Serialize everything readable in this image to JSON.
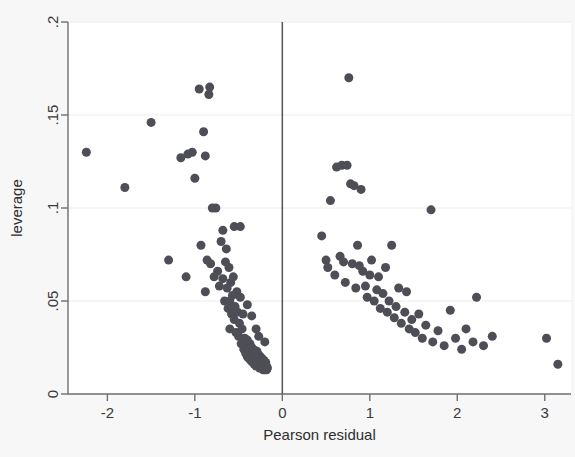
{
  "figure": {
    "background_color": "#f7f7f7",
    "plot_background_color": "#ffffff",
    "marker_color": "#4e4e56",
    "axis_color": "#6f6f6f",
    "gridline_color": "#ececec",
    "refline_color": "#555555"
  },
  "chart_data": {
    "type": "scatter",
    "title": "",
    "xlabel": "Pearson residual",
    "ylabel": "leverage",
    "xlim": [
      -2.45,
      3.3
    ],
    "ylim": [
      0,
      0.2
    ],
    "xticks": [
      -2,
      -1,
      0,
      1,
      2,
      3
    ],
    "xticklabels": [
      "-2",
      "-1",
      "0",
      "1",
      "2",
      "3"
    ],
    "yticks": [
      0,
      0.05,
      0.1,
      0.15,
      0.2
    ],
    "yticklabels": [
      "0",
      ".05",
      ".1",
      ".15",
      ".2"
    ],
    "grid": "horizontal",
    "legend": "none",
    "annotations": [
      {
        "type": "vline",
        "x": 0,
        "label": "zero-residual reference line"
      }
    ],
    "marker_size_px": 9,
    "series": [
      {
        "name": "observations",
        "points": [
          [
            -2.24,
            0.13
          ],
          [
            -1.8,
            0.111
          ],
          [
            -1.5,
            0.146
          ],
          [
            -1.3,
            0.072
          ],
          [
            -1.16,
            0.127
          ],
          [
            -1.08,
            0.129
          ],
          [
            -1.03,
            0.13
          ],
          [
            -1.0,
            0.116
          ],
          [
            -0.95,
            0.164
          ],
          [
            -0.93,
            0.08
          ],
          [
            -0.9,
            0.141
          ],
          [
            -0.88,
            0.128
          ],
          [
            -0.86,
            0.072
          ],
          [
            -0.84,
            0.161
          ],
          [
            -0.83,
            0.165
          ],
          [
            -0.82,
            0.07
          ],
          [
            -0.8,
            0.1
          ],
          [
            -0.78,
            0.063
          ],
          [
            -0.76,
            0.1
          ],
          [
            -0.74,
            0.066
          ],
          [
            -0.72,
            0.058
          ],
          [
            -0.7,
            0.082
          ],
          [
            -0.68,
            0.062
          ],
          [
            -0.66,
            0.05
          ],
          [
            -0.65,
            0.071
          ],
          [
            -0.64,
            0.078
          ],
          [
            -0.63,
            0.057
          ],
          [
            -0.62,
            0.046
          ],
          [
            -0.61,
            0.068
          ],
          [
            -0.6,
            0.05
          ],
          [
            -0.59,
            0.06
          ],
          [
            -0.58,
            0.043
          ],
          [
            -0.57,
            0.053
          ],
          [
            -0.56,
            0.063
          ],
          [
            -0.55,
            0.04
          ],
          [
            -0.54,
            0.047
          ],
          [
            -0.53,
            0.033
          ],
          [
            -0.52,
            0.055
          ],
          [
            -0.51,
            0.044
          ],
          [
            -0.5,
            0.031
          ],
          [
            -0.49,
            0.038
          ],
          [
            -0.48,
            0.052
          ],
          [
            -0.47,
            0.027
          ],
          [
            -0.46,
            0.035
          ],
          [
            -0.45,
            0.043
          ],
          [
            -0.44,
            0.024
          ],
          [
            -0.43,
            0.03
          ],
          [
            -0.42,
            0.022
          ],
          [
            -0.41,
            0.026
          ],
          [
            -0.4,
            0.02
          ],
          [
            -0.4,
            0.029
          ],
          [
            -0.39,
            0.024
          ],
          [
            -0.38,
            0.019
          ],
          [
            -0.37,
            0.022
          ],
          [
            -0.37,
            0.027
          ],
          [
            -0.36,
            0.018
          ],
          [
            -0.35,
            0.021
          ],
          [
            -0.35,
            0.025
          ],
          [
            -0.34,
            0.017
          ],
          [
            -0.33,
            0.02
          ],
          [
            -0.33,
            0.024
          ],
          [
            -0.32,
            0.019
          ],
          [
            -0.32,
            0.016
          ],
          [
            -0.31,
            0.022
          ],
          [
            -0.31,
            0.018
          ],
          [
            -0.3,
            0.015
          ],
          [
            -0.3,
            0.02
          ],
          [
            -0.29,
            0.017
          ],
          [
            -0.29,
            0.023
          ],
          [
            -0.28,
            0.015
          ],
          [
            -0.28,
            0.019
          ],
          [
            -0.27,
            0.016
          ],
          [
            -0.27,
            0.021
          ],
          [
            -0.26,
            0.014
          ],
          [
            -0.26,
            0.018
          ],
          [
            -0.25,
            0.016
          ],
          [
            -0.25,
            0.02
          ],
          [
            -0.24,
            0.014
          ],
          [
            -0.24,
            0.017
          ],
          [
            -0.23,
            0.015
          ],
          [
            -0.23,
            0.019
          ],
          [
            -0.22,
            0.013
          ],
          [
            -0.22,
            0.016
          ],
          [
            -0.21,
            0.014
          ],
          [
            -0.21,
            0.018
          ],
          [
            -0.2,
            0.013
          ],
          [
            -0.2,
            0.016
          ],
          [
            -0.19,
            0.014
          ],
          [
            -0.19,
            0.017
          ],
          [
            -0.18,
            0.013
          ],
          [
            -0.18,
            0.015
          ],
          [
            -0.17,
            0.014
          ],
          [
            -0.55,
            0.09
          ],
          [
            -0.6,
            0.035
          ],
          [
            -0.68,
            0.088
          ],
          [
            -0.48,
            0.09
          ],
          [
            -0.3,
            0.035
          ],
          [
            -0.88,
            0.055
          ],
          [
            -1.1,
            0.063
          ],
          [
            -0.4,
            0.048
          ],
          [
            -0.35,
            0.042
          ],
          [
            -0.2,
            0.028
          ],
          [
            -0.27,
            0.031
          ],
          [
            0.45,
            0.085
          ],
          [
            0.5,
            0.072
          ],
          [
            0.52,
            0.068
          ],
          [
            0.55,
            0.104
          ],
          [
            0.6,
            0.064
          ],
          [
            0.62,
            0.122
          ],
          [
            0.68,
            0.123
          ],
          [
            0.74,
            0.123
          ],
          [
            0.66,
            0.074
          ],
          [
            0.7,
            0.071
          ],
          [
            0.72,
            0.06
          ],
          [
            0.76,
            0.17
          ],
          [
            0.78,
            0.113
          ],
          [
            0.8,
            0.07
          ],
          [
            0.82,
            0.112
          ],
          [
            0.84,
            0.057
          ],
          [
            0.86,
            0.08
          ],
          [
            0.88,
            0.069
          ],
          [
            0.9,
            0.11
          ],
          [
            0.92,
            0.066
          ],
          [
            0.95,
            0.058
          ],
          [
            0.97,
            0.052
          ],
          [
            1.0,
            0.064
          ],
          [
            1.02,
            0.072
          ],
          [
            1.05,
            0.05
          ],
          [
            1.08,
            0.056
          ],
          [
            1.1,
            0.063
          ],
          [
            1.12,
            0.046
          ],
          [
            1.15,
            0.054
          ],
          [
            1.18,
            0.068
          ],
          [
            1.2,
            0.044
          ],
          [
            1.22,
            0.05
          ],
          [
            1.25,
            0.08
          ],
          [
            1.28,
            0.041
          ],
          [
            1.3,
            0.047
          ],
          [
            1.33,
            0.057
          ],
          [
            1.36,
            0.038
          ],
          [
            1.4,
            0.044
          ],
          [
            1.42,
            0.055
          ],
          [
            1.45,
            0.035
          ],
          [
            1.48,
            0.04
          ],
          [
            1.52,
            0.033
          ],
          [
            1.56,
            0.043
          ],
          [
            1.6,
            0.03
          ],
          [
            1.64,
            0.037
          ],
          [
            1.7,
            0.099
          ],
          [
            1.72,
            0.028
          ],
          [
            1.78,
            0.034
          ],
          [
            1.85,
            0.026
          ],
          [
            1.92,
            0.045
          ],
          [
            1.98,
            0.03
          ],
          [
            2.05,
            0.024
          ],
          [
            2.1,
            0.035
          ],
          [
            2.18,
            0.028
          ],
          [
            2.22,
            0.052
          ],
          [
            2.3,
            0.026
          ],
          [
            2.4,
            0.031
          ],
          [
            3.02,
            0.03
          ],
          [
            3.15,
            0.016
          ]
        ]
      }
    ]
  }
}
